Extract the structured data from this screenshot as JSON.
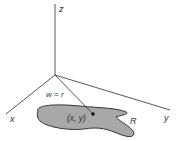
{
  "diagram": {
    "axes": {
      "z_label": "z",
      "x_label": "x",
      "y_label": "y"
    },
    "region_label": "R",
    "point_label": "(x, y)",
    "segment_label": "w = r",
    "colors": {
      "line": "#444444",
      "region_fill": "#a8a8a8",
      "region_stroke": "#333333",
      "background": "#ffffff"
    }
  }
}
